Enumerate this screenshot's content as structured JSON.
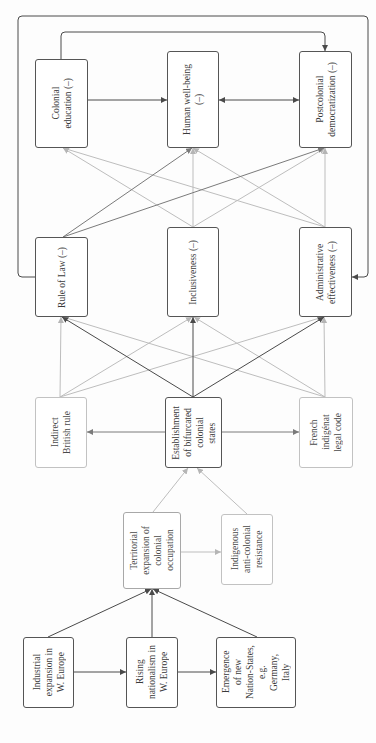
{
  "nodes": {
    "colonial_education": {
      "label": "Colonial\neducation (–)"
    },
    "human_wellbeing": {
      "label": "Human well-being\n(–)"
    },
    "postcolonial_democratization": {
      "label": "Postcolonial\ndemocratization (–)"
    },
    "rule_of_law": {
      "label": "Rule of Law (–)"
    },
    "inclusiveness": {
      "label": "Inclusiveness (–)"
    },
    "administrative_effectiveness": {
      "label": "Administrative\neffectiveness (–)"
    },
    "indirect_british_rule": {
      "label": "Indirect\nBritish rule"
    },
    "bifurcated_colonial_states": {
      "label": "Establishment\nof bifurcated\ncolonial\nstates"
    },
    "french_indigenat": {
      "label": "French\nindigénat\nlegal code"
    },
    "territorial_expansion": {
      "label": "Territorial\nexpansion of\ncolonial\noccupation"
    },
    "indigenous_resistance": {
      "label": "Indigenous\nanti-colonial\nresistance"
    },
    "industrial_expansion": {
      "label": "Industrial\nexpansion in\nW. Europe"
    },
    "rising_nationalism": {
      "label": "Rising\nnationalism in\nW. Europe"
    },
    "new_nation_states": {
      "label": "Emergence\nof new\nNation-States,\ne.g.\nGermany,\nItaly"
    }
  },
  "edges": [
    {
      "from": "industrial_expansion",
      "to": "territorial_expansion",
      "style": "dark"
    },
    {
      "from": "rising_nationalism",
      "to": "territorial_expansion",
      "style": "dark"
    },
    {
      "from": "new_nation_states",
      "to": "territorial_expansion",
      "style": "dark"
    },
    {
      "from": "industrial_expansion",
      "to": "rising_nationalism",
      "style": "dark"
    },
    {
      "from": "rising_nationalism",
      "to": "new_nation_states",
      "style": "dark"
    },
    {
      "from": "territorial_expansion",
      "to": "indigenous_resistance",
      "style": "light"
    },
    {
      "from": "territorial_expansion",
      "to": "bifurcated_colonial_states",
      "style": "light"
    },
    {
      "from": "indigenous_resistance",
      "to": "bifurcated_colonial_states",
      "style": "light"
    },
    {
      "from": "bifurcated_colonial_states",
      "to": "indirect_british_rule",
      "style": "mid"
    },
    {
      "from": "bifurcated_colonial_states",
      "to": "french_indigenat",
      "style": "mid"
    },
    {
      "from": "bifurcated_colonial_states",
      "to": "rule_of_law",
      "style": "dark"
    },
    {
      "from": "bifurcated_colonial_states",
      "to": "inclusiveness",
      "style": "dark"
    },
    {
      "from": "bifurcated_colonial_states",
      "to": "administrative_effectiveness",
      "style": "dark"
    },
    {
      "from": "indirect_british_rule",
      "to": "rule_of_law",
      "style": "light"
    },
    {
      "from": "indirect_british_rule",
      "to": "inclusiveness",
      "style": "light"
    },
    {
      "from": "indirect_british_rule",
      "to": "administrative_effectiveness",
      "style": "light"
    },
    {
      "from": "french_indigenat",
      "to": "rule_of_law",
      "style": "light"
    },
    {
      "from": "french_indigenat",
      "to": "inclusiveness",
      "style": "light"
    },
    {
      "from": "french_indigenat",
      "to": "administrative_effectiveness",
      "style": "light"
    },
    {
      "from": "rule_of_law",
      "to": "human_wellbeing",
      "style": "mid"
    },
    {
      "from": "rule_of_law",
      "to": "postcolonial_democratization",
      "style": "mid"
    },
    {
      "from": "inclusiveness",
      "to": "colonial_education",
      "style": "light"
    },
    {
      "from": "inclusiveness",
      "to": "human_wellbeing",
      "style": "light"
    },
    {
      "from": "inclusiveness",
      "to": "postcolonial_democratization",
      "style": "light"
    },
    {
      "from": "administrative_effectiveness",
      "to": "colonial_education",
      "style": "light"
    },
    {
      "from": "administrative_effectiveness",
      "to": "human_wellbeing",
      "style": "light"
    },
    {
      "from": "administrative_effectiveness",
      "to": "postcolonial_democratization",
      "style": "light"
    },
    {
      "from": "colonial_education",
      "to": "human_wellbeing",
      "style": "dark"
    },
    {
      "from": "human_wellbeing",
      "to": "postcolonial_democratization",
      "style": "dark",
      "bidirectional": true
    },
    {
      "from": "colonial_education",
      "to": "postcolonial_democratization",
      "style": "dark",
      "routing": "loop-top"
    },
    {
      "from": "rule_of_law",
      "to": "administrative_effectiveness",
      "style": "dark",
      "routing": "outer-loop"
    }
  ],
  "colors": {
    "dark": "#4a4a4a",
    "mid": "#7a7a7a",
    "light": "#bdbdbd",
    "box_border": "#555555",
    "box_border_light": "#c2c2c2",
    "text": "#3a3a3a"
  }
}
